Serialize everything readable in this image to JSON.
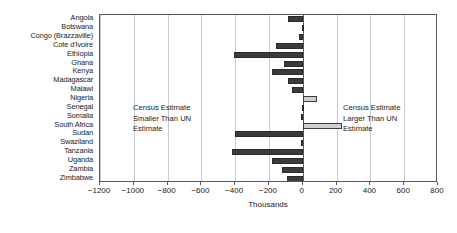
{
  "chart_data": {
    "type": "bar",
    "orientation": "horizontal",
    "title": "",
    "subtitle": "",
    "xlabel": "Thousands",
    "ylabel": "",
    "xlim": [
      -1200,
      800
    ],
    "xticks": [
      -1200,
      -1000,
      -800,
      -600,
      -400,
      -200,
      0,
      200,
      400,
      600,
      800
    ],
    "xticklabels": [
      "−1200",
      "−1000",
      "−800",
      "−600",
      "−400",
      "−200",
      "0",
      "200",
      "400",
      "600",
      "800"
    ],
    "grid": "vertical",
    "legend": "none",
    "categories": [
      "Angola",
      "Botswana",
      "Congo (Brazzaville)",
      "Cote d'Ivoire",
      "Ethiopia",
      "Ghana",
      "Kenya",
      "Madagascar",
      "Malawi",
      "Nigeria",
      "Senegal",
      "Somalia",
      "South Africa",
      "Sudan",
      "Swaziland",
      "Tanzania",
      "Uganda",
      "Zambia",
      "Zimbabwe"
    ],
    "values": [
      -90,
      -5,
      -20,
      -160,
      -405,
      -110,
      -180,
      -85,
      -65,
      85,
      -5,
      -8,
      230,
      -400,
      -8,
      -420,
      -185,
      -125,
      -95
    ],
    "colors": {
      "negative_fill": "#3b3b3b",
      "negative_border": "#2a2a2a",
      "positive_fill": "#cfcfcf",
      "positive_border": "#3b3b3b",
      "gridline": "#c9cdd1",
      "axis": "#54585c",
      "background": "#ffffff"
    },
    "annotations": [
      {
        "name": "left-annotation",
        "lines": [
          "Census Estimate",
          "Smaller Than UN",
          "Estimate"
        ],
        "side": "left"
      },
      {
        "name": "right-annotation",
        "lines": [
          "Census Estimate",
          "Larger Than UN",
          "Estimate"
        ],
        "side": "right"
      }
    ]
  }
}
